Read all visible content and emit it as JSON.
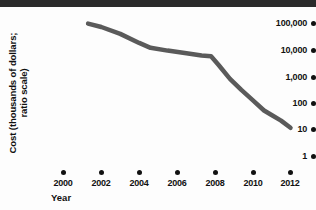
{
  "chart_data": {
    "type": "line",
    "title": "",
    "xlabel": "Year",
    "ylabel": "Cost (thousands of dollars; ratio scale)",
    "ylabel_lines": [
      "Cost (thousands of dollars;",
      "ratio scale)"
    ],
    "yscale": "log",
    "ytick_labels": [
      "100,000",
      "10,000",
      "1,000",
      "100",
      "10",
      "1"
    ],
    "ytick_values": [
      100000,
      10000,
      1000,
      100,
      10,
      1
    ],
    "ylim": [
      1,
      100000
    ],
    "xtick_labels": [
      "2000",
      "2002",
      "2004",
      "2006",
      "2008",
      "2010",
      "2012"
    ],
    "xtick_values": [
      2000,
      2002,
      2004,
      2006,
      2008,
      2010,
      2012
    ],
    "xlim": [
      2000,
      2012
    ],
    "grid": false,
    "legend": false,
    "series": [
      {
        "name": "Cost",
        "x": [
          2001.3,
          2002.0,
          2003.0,
          2004.0,
          2004.6,
          2005.5,
          2006.5,
          2007.3,
          2007.8,
          2008.2,
          2008.8,
          2009.4,
          2010.0,
          2010.6,
          2011.0,
          2011.5,
          2012.0
        ],
        "y": [
          95000,
          70000,
          38000,
          17000,
          11000,
          8600,
          6800,
          5600,
          5200,
          2400,
          700,
          260,
          105,
          42,
          28,
          17,
          9
        ]
      }
    ],
    "line_color": "#5a5a5a",
    "line_width": 4.5,
    "axis_color": "#111111",
    "background": "#fdfdfd"
  },
  "decor": {
    "top_bar_color": "#2b2b2b"
  }
}
